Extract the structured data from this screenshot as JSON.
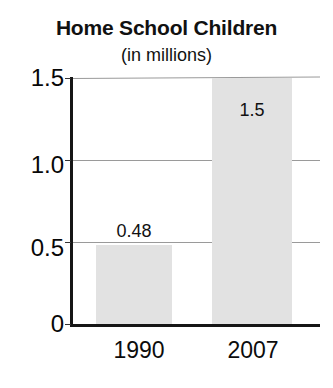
{
  "chart_data": {
    "type": "bar",
    "title": "Home School Children",
    "subtitle": "(in millions)",
    "xlabel": "",
    "ylabel": "",
    "categories": [
      "1990",
      "2007"
    ],
    "values": [
      0.48,
      1.5
    ],
    "data_labels": [
      "0.48",
      "1.5"
    ],
    "ylim": [
      0,
      1.5
    ],
    "yticks": [
      0,
      0.5,
      1.0,
      1.5
    ],
    "ytick_labels": [
      "0",
      "0.5",
      "1.0",
      "1.5"
    ],
    "grid": true,
    "legend": false,
    "bar_color": "#e2e2e2",
    "axis_color": "#161616",
    "gridline_color": "#9a9a9a",
    "text_color": "#111111"
  },
  "axes": {
    "y_ticks": [
      {
        "label": "1.5",
        "value": 1.5
      },
      {
        "label": "1.0",
        "value": 1.0
      },
      {
        "label": "0.5",
        "value": 0.5
      },
      {
        "label": "0",
        "value": 0
      }
    ],
    "x_ticks": [
      {
        "label": "1990"
      },
      {
        "label": "2007"
      }
    ]
  },
  "bars": [
    {
      "category": "1990",
      "value": 0.48,
      "label": "0.48"
    },
    {
      "category": "2007",
      "value": 1.5,
      "label": "1.5"
    }
  ]
}
